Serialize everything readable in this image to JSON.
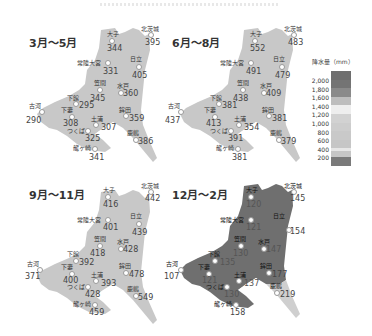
{
  "legend": {
    "title": "降水量（mm）",
    "ticks": [
      "2,000",
      "1,800",
      "1,600",
      "1,400",
      "1,200",
      "1,000",
      "800",
      "600",
      "400",
      "200"
    ],
    "colors": [
      "#6e6e6e",
      "#777777",
      "#8a8a8a",
      "#bdbdbd",
      "#ededed",
      "#cfcfcf",
      "#cccccc",
      "#c9c9c9",
      "#c6c6c6",
      "#e6e6e6",
      "#7a7a7a"
    ]
  },
  "map_fill": {
    "light": "#c8c8c8",
    "dark": "#6f6f6f"
  },
  "panels": [
    {
      "season": "3月〜5月",
      "stations": [
        {
          "name": "大子",
          "value": "344"
        },
        {
          "name": "北茨城",
          "value": "395"
        },
        {
          "name": "常陸大宮",
          "value": "331"
        },
        {
          "name": "日立",
          "value": "405"
        },
        {
          "name": "笠間",
          "value": "345"
        },
        {
          "name": "水戸",
          "value": "360"
        },
        {
          "name": "下館",
          "value": "295"
        },
        {
          "name": "古河",
          "value": "290"
        },
        {
          "name": "下妻",
          "value": "308"
        },
        {
          "name": "土浦",
          "value": "307"
        },
        {
          "name": "つくば",
          "value": "325"
        },
        {
          "name": "鉾田",
          "value": "359"
        },
        {
          "name": "鹿嶋",
          "value": "386"
        },
        {
          "name": "龍ヶ崎",
          "value": "341"
        }
      ]
    },
    {
      "season": "6月〜8月",
      "stations": [
        {
          "name": "大子",
          "value": "552"
        },
        {
          "name": "北茨城",
          "value": "483"
        },
        {
          "name": "常陸大宮",
          "value": "491"
        },
        {
          "name": "日立",
          "value": "479"
        },
        {
          "name": "笠間",
          "value": "438"
        },
        {
          "name": "水戸",
          "value": "409"
        },
        {
          "name": "下館",
          "value": "381"
        },
        {
          "name": "古河",
          "value": "437"
        },
        {
          "name": "下妻",
          "value": "413"
        },
        {
          "name": "土浦",
          "value": "354"
        },
        {
          "name": "つくば",
          "value": "391"
        },
        {
          "name": "鉾田",
          "value": "381"
        },
        {
          "name": "鹿嶋",
          "value": "379"
        },
        {
          "name": "龍ヶ崎",
          "value": "381"
        }
      ]
    },
    {
      "season": "9月〜11月",
      "stations": [
        {
          "name": "大子",
          "value": "416"
        },
        {
          "name": "北茨城",
          "value": "442"
        },
        {
          "name": "常陸大宮",
          "value": "401"
        },
        {
          "name": "日立",
          "value": "439"
        },
        {
          "name": "笠間",
          "value": "418"
        },
        {
          "name": "水戸",
          "value": "428"
        },
        {
          "name": "下館",
          "value": "392"
        },
        {
          "name": "古河",
          "value": "371"
        },
        {
          "name": "下妻",
          "value": "400"
        },
        {
          "name": "土浦",
          "value": "393"
        },
        {
          "name": "つくば",
          "value": "428"
        },
        {
          "name": "鉾田",
          "value": "478"
        },
        {
          "name": "鹿嶋",
          "value": "549"
        },
        {
          "name": "龍ヶ崎",
          "value": "459"
        }
      ]
    },
    {
      "season": "12月〜2月",
      "stations": [
        {
          "name": "大子",
          "value": "120"
        },
        {
          "name": "北茨城",
          "value": "145"
        },
        {
          "name": "常陸大宮",
          "value": "121"
        },
        {
          "name": "日立",
          "value": "154"
        },
        {
          "name": "笠間",
          "value": "130"
        },
        {
          "name": "水戸",
          "value": "147"
        },
        {
          "name": "下館",
          "value": "135"
        },
        {
          "name": "古河",
          "value": "107"
        },
        {
          "name": "下妻",
          "value": "121"
        },
        {
          "name": "土浦",
          "value": "137"
        },
        {
          "name": "つくば",
          "value": "130"
        },
        {
          "name": "鉾田",
          "value": "177"
        },
        {
          "name": "鹿嶋",
          "value": "219"
        },
        {
          "name": "龍ヶ崎",
          "value": "158"
        }
      ]
    }
  ]
}
